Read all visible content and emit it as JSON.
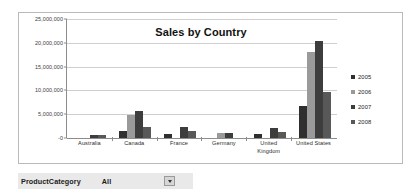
{
  "chart_data": {
    "type": "bar",
    "title": "Sales by Country",
    "xlabel": "",
    "ylabel": "",
    "ylim": [
      0,
      25000000
    ],
    "grid": true,
    "legend_position": "right",
    "ytick_labels": [
      "25,000,000",
      "20,000,000",
      "15,000,000",
      "10,000,000",
      "5,000,000",
      "-0"
    ],
    "ytick_values": [
      25000000,
      20000000,
      15000000,
      10000000,
      5000000,
      0
    ],
    "categories": [
      "Australia",
      "Canada",
      "France",
      "Germany",
      "United Kingdom",
      "United States"
    ],
    "category_lines": [
      [
        "Australia"
      ],
      [
        "Canada"
      ],
      [
        "France"
      ],
      [
        "Germany"
      ],
      [
        "United",
        "Kingdom"
      ],
      [
        "United States"
      ]
    ],
    "series": [
      {
        "name": "2005",
        "color": "#2f2f2f",
        "values": [
          0,
          1500000,
          900000,
          0,
          850000,
          6800000
        ]
      },
      {
        "name": "2006",
        "color": "#9a9a9a",
        "values": [
          0,
          4800000,
          0,
          1100000,
          0,
          18000000
        ]
      },
      {
        "name": "2007",
        "color": "#3d3d3d",
        "values": [
          650000,
          5600000,
          2400000,
          950000,
          2200000,
          20300000
        ]
      },
      {
        "name": "2008",
        "color": "#585858",
        "values": [
          600000,
          2400000,
          1400000,
          0,
          1300000,
          9700000
        ]
      }
    ]
  },
  "parameter_bar": {
    "label": "ProductCategory",
    "value": "All",
    "dropdown_icon": "chevron-down-icon"
  }
}
